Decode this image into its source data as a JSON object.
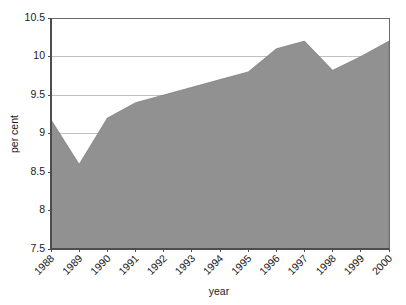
{
  "chart_data": {
    "type": "area",
    "title": "",
    "subtitle": "",
    "xlabel": "year",
    "ylabel": "per cent",
    "categories": [
      "1988",
      "1989",
      "1990",
      "1991",
      "1992",
      "1993",
      "1994",
      "1995",
      "1996",
      "1997",
      "1998",
      "1999",
      "2000"
    ],
    "values": [
      9.18,
      8.6,
      9.2,
      9.4,
      9.5,
      9.6,
      9.7,
      9.8,
      10.1,
      10.2,
      9.82,
      10.0,
      10.2
    ],
    "x": [
      1988,
      1989,
      1990,
      1991,
      1992,
      1993,
      1994,
      1995,
      1996,
      1997,
      1998,
      1999,
      2000
    ],
    "series": [
      {
        "name": "per cent",
        "values": [
          9.18,
          8.6,
          9.2,
          9.4,
          9.5,
          9.6,
          9.7,
          9.8,
          10.1,
          10.2,
          9.82,
          10.0,
          10.2
        ]
      }
    ],
    "ylim": [
      7.5,
      10.5
    ],
    "ytick_labels": [
      "7.5",
      "8",
      "8.5",
      "9",
      "9.5",
      "10",
      "10.5"
    ],
    "ytick_values": [
      7.5,
      8,
      8.5,
      9,
      9.5,
      10,
      10.5
    ],
    "grid": true,
    "grid_axis": "y",
    "legend": false,
    "legend_position": "none",
    "fill_color": "#919191",
    "grid_color": "#b9b9b9",
    "axis_color": "#4d4d4d",
    "background_color": "#ffffff",
    "xtick_rotation": 45
  }
}
